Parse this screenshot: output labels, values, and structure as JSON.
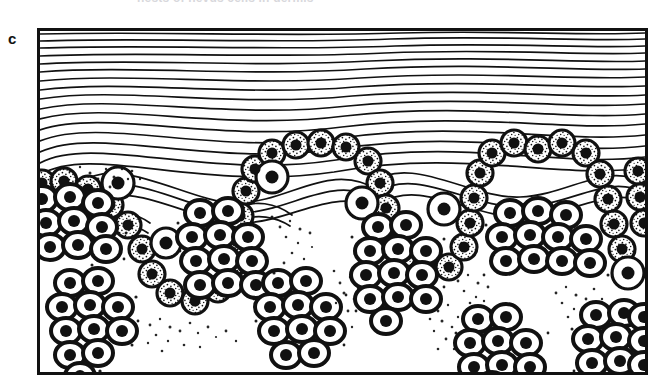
{
  "caption": {
    "fragment_text": "nests of nevus cells in dermis",
    "visible": "partially cut off at top edge"
  },
  "panel": {
    "letter": "c"
  },
  "figure": {
    "name": "histology-schematic-skin-nevus",
    "frame": {
      "x": 37,
      "y": 28,
      "width": 611,
      "height": 347,
      "border_px": 3
    },
    "colors": {
      "ink": "#111111",
      "paper": "#ffffff"
    },
    "layers": [
      {
        "name": "stratum-corneum",
        "label": "wavy keratin lines",
        "line_count": 26
      },
      {
        "name": "epidermis",
        "label": "undulating epithelium with rete ridges",
        "rete_ridge_count": 4
      },
      {
        "name": "basal-cell-layer",
        "label": "row of nucleated cells along dermo-epidermal junction"
      },
      {
        "name": "dermis",
        "label": "pale background with melanin stipple"
      }
    ],
    "rete_ridges": [
      {
        "index": 1,
        "center_x": 115,
        "depth_y": 175
      },
      {
        "index": 2,
        "center_x": 252,
        "depth_y": 192
      },
      {
        "index": 3,
        "center_x": 395,
        "depth_y": 190
      },
      {
        "index": 4,
        "center_x": 540,
        "depth_y": 185
      }
    ],
    "cell_nests": [
      {
        "id": "nest-1",
        "cx": 38,
        "cy": 190,
        "cells": 9,
        "cols": 3,
        "rows": 3
      },
      {
        "id": "nest-2",
        "cx": 60,
        "cy": 295,
        "cells": 11,
        "cols": 3,
        "rows": 4
      },
      {
        "id": "nest-3",
        "cx": 182,
        "cy": 222,
        "cells": 11,
        "cols": 3,
        "rows": 4
      },
      {
        "id": "nest-4",
        "cx": 258,
        "cy": 300,
        "cells": 10,
        "cols": 3,
        "rows": 4
      },
      {
        "id": "nest-5",
        "cx": 358,
        "cy": 248,
        "cells": 12,
        "cols": 3,
        "rows": 4
      },
      {
        "id": "nest-6",
        "cx": 490,
        "cy": 222,
        "cells": 11,
        "cols": 4,
        "rows": 3
      },
      {
        "id": "nest-7",
        "cx": 468,
        "cy": 330,
        "cells": 9,
        "cols": 3,
        "rows": 3
      },
      {
        "id": "nest-8",
        "cx": 588,
        "cy": 330,
        "cells": 10,
        "cols": 3,
        "rows": 3
      }
    ],
    "melanin_clouds": [
      {
        "cx": 75,
        "cy": 168
      },
      {
        "cx": 148,
        "cy": 295
      },
      {
        "cx": 275,
        "cy": 250
      },
      {
        "cx": 348,
        "cy": 300
      },
      {
        "cx": 430,
        "cy": 300
      },
      {
        "cx": 455,
        "cy": 268
      },
      {
        "cx": 600,
        "cy": 285
      }
    ]
  }
}
